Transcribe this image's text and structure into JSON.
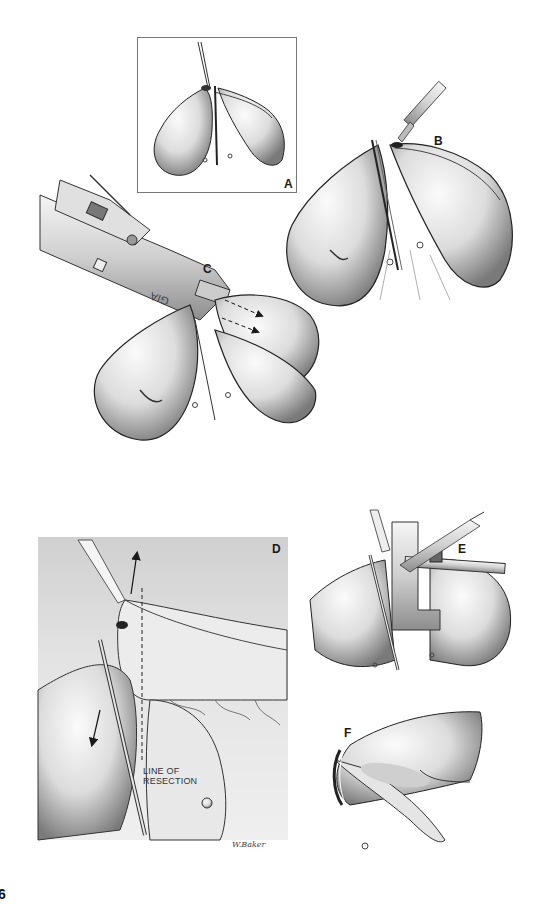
{
  "figure": {
    "page_number": "6",
    "panels": [
      {
        "id": "A",
        "label": "A",
        "description": "Two loops of bowel held together with traction suture and clamp, boxed inset"
      },
      {
        "id": "B",
        "label": "B",
        "description": "Scalpel making enterotomy at apposed bowel loops held with clamp"
      },
      {
        "id": "C",
        "label": "C",
        "description": "GIA stapler inserted into loops; dashed arrows show firing direction"
      },
      {
        "id": "D",
        "label": "D",
        "description": "Close-up of mesentery with forceps and clamp; arrows showing traction; dashed resection line"
      },
      {
        "id": "E",
        "label": "E",
        "description": "Linear stapler closing common enterotomy while scalpel trims excess"
      },
      {
        "id": "F",
        "label": "F",
        "description": "Completed side-to-side anastomosis with staple line"
      }
    ],
    "annotations": {
      "stapler_text": "GIA",
      "line_of_resection": [
        "LINE OF",
        "RESECTION"
      ]
    },
    "signature": "W.Baker",
    "colors": {
      "ink": "#1a1a1a",
      "tissue_light": "#f2f2f2",
      "tissue_shadow": "#8a8a8a",
      "background_D": "#d9d9d9",
      "frame": "#777777"
    }
  }
}
